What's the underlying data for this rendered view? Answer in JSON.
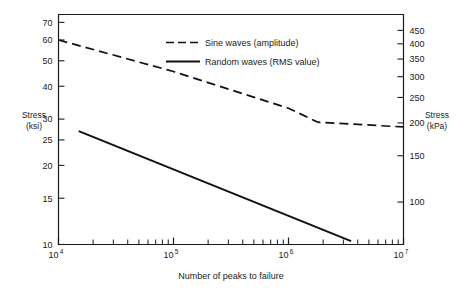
{
  "chart_data": {
    "type": "line",
    "title": "",
    "xlabel": "Number of peaks to failure",
    "ylabel_left": "Stress",
    "ylabel_left_units": "(ksi)",
    "ylabel_right": "Stress",
    "ylabel_right_units": "(kPa)",
    "xscale": "log",
    "yscale": "log",
    "xlim": [
      10000,
      10000000
    ],
    "ylim_left": [
      10,
      75
    ],
    "ylim_right": [
      69,
      517
    ],
    "grid": false,
    "legend_position": "top-center",
    "x_tick_labels": [
      "10",
      "10",
      "10",
      "10"
    ],
    "x_tick_exponents": [
      "4",
      "5",
      "6",
      "7"
    ],
    "x_tick_values": [
      10000,
      100000,
      1000000,
      10000000
    ],
    "y_left_tick_labels": [
      "70",
      "60",
      "50",
      "40",
      "30",
      "25",
      "20",
      "15",
      "10"
    ],
    "y_left_tick_values": [
      70,
      60,
      50,
      40,
      30,
      25,
      20,
      15,
      10
    ],
    "y_right_tick_labels": [
      "450",
      "400",
      "350",
      "300",
      "250",
      "200",
      "150",
      "100"
    ],
    "y_right_tick_values": [
      450,
      400,
      350,
      300,
      250,
      200,
      150,
      100
    ],
    "series": [
      {
        "name": "Sine waves (amplitude)",
        "style": "dashed",
        "color": "#111111",
        "points": [
          {
            "x": 10000,
            "y": 60.0
          },
          {
            "x": 100000,
            "y": 45.5
          },
          {
            "x": 1000000,
            "y": 33.0
          },
          {
            "x": 1800000,
            "y": 29.2
          },
          {
            "x": 10000000,
            "y": 28.0
          }
        ]
      },
      {
        "name": "Random waves (RMS value)",
        "style": "solid",
        "color": "#111111",
        "points": [
          {
            "x": 15000,
            "y": 27.0
          },
          {
            "x": 3500000,
            "y": 10.3
          }
        ]
      }
    ]
  },
  "legend": {
    "items": [
      {
        "label": "Sine waves (amplitude)",
        "style": "dashed"
      },
      {
        "label": "Random waves (RMS value)",
        "style": "solid"
      }
    ]
  },
  "axes": {
    "left_title_line1": "Stress",
    "left_title_line2": "(ksi)",
    "right_title_line1": "Stress",
    "right_title_line2": "(kPa)",
    "x_title": "Number of peaks to failure"
  }
}
